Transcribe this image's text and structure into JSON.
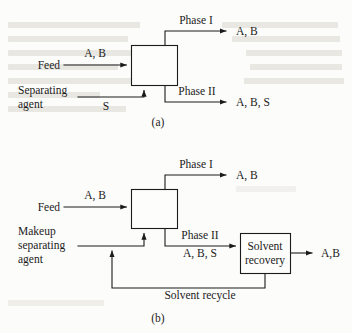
{
  "figure": {
    "background_color": "#fcfcfa",
    "line_color": "#1b1b1b"
  },
  "diagram_a": {
    "caption": "(a)",
    "unit_box": {
      "label": ""
    },
    "streams": {
      "feed_label": "Feed",
      "feed_components": "A, B",
      "separating_agent_label_line1": "Separating",
      "separating_agent_label_line2": "agent",
      "separating_agent_components": "S",
      "phase_1_label": "Phase I",
      "phase_1_components": "A, B",
      "phase_2_label": "Phase II",
      "phase_2_components": "A, B, S"
    }
  },
  "diagram_b": {
    "caption": "(b)",
    "unit_box": {
      "label": ""
    },
    "solvent_recovery_box": {
      "label_line1": "Solvent",
      "label_line2": "recovery"
    },
    "streams": {
      "feed_label": "Feed",
      "feed_components": "A, B",
      "makeup_label_line1": "Makeup",
      "makeup_label_line2": "separating",
      "makeup_label_line3": "agent",
      "phase_1_label": "Phase I",
      "phase_1_components": "A, B",
      "phase_2_label": "Phase II",
      "phase_2_components": "A, B, S",
      "product_components": "A,B",
      "recycle_label": "Solvent recycle"
    }
  }
}
